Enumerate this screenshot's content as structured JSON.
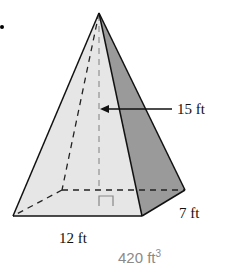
{
  "figure": {
    "type": "square-based pyramid (rectangular base)",
    "labels": {
      "height": "15 ft",
      "width": "7 ft",
      "length": "12 ft"
    },
    "volume": {
      "value": "420 ft",
      "exponent": "3"
    },
    "colors": {
      "front_face": "#e6e6e6",
      "side_face": "#9a9a9a",
      "outline": "#111111",
      "hidden_edges": "#222222",
      "height_line": "#999999",
      "volume_text": "#8a8a8a"
    }
  }
}
